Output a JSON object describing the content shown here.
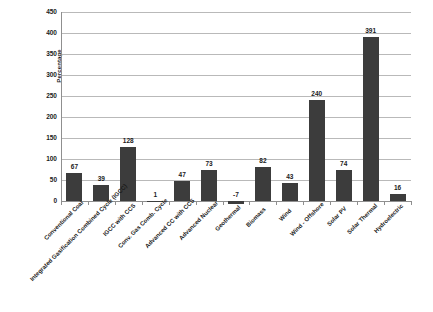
{
  "chart_data": {
    "type": "bar",
    "title": "",
    "subtitle": "",
    "xlabel": "",
    "ylabel": "Percentage",
    "ylim": [
      0,
      450
    ],
    "ytick_values": [
      0,
      50,
      100,
      150,
      200,
      250,
      300,
      350,
      400,
      450
    ],
    "ytick_labels": [
      "0",
      "50",
      "100",
      "150",
      "200",
      "250",
      "300",
      "350",
      "400",
      "450"
    ],
    "grid": true,
    "legend": "none",
    "bar_color": "#3c3c3c",
    "gridline_color": "#b9b9b9",
    "axis_color": "#8f8f8f",
    "background_color": "#ffffff",
    "categories": [
      "Conventional Coal",
      "Integrated Gasification Combined Cycle (IGCC)",
      "IGCC with CCS",
      "Conv. Gas Comb. Cycle",
      "Advanced CC with CCS",
      "Advanced Nuclear",
      "Geothermal",
      "Biomass",
      "Wind",
      "Wind - Offshore",
      "Solar PV",
      "Solar Thermal",
      "Hydroelectric"
    ],
    "values": [
      67,
      39,
      128,
      1,
      47,
      73,
      -7,
      82,
      43,
      240,
      74,
      391,
      16
    ],
    "value_labels": [
      "67",
      "39",
      "128",
      "1",
      "47",
      "73",
      "-7",
      "82",
      "43",
      "240",
      "74",
      "391",
      "16"
    ]
  }
}
